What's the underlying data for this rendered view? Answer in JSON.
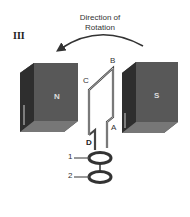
{
  "figure": {
    "panel_label": "III",
    "title_line1": "Direction of",
    "title_line2": "Rotation",
    "magnets": [
      {
        "pole": "N",
        "side": "left"
      },
      {
        "pole": "S",
        "side": "right"
      }
    ],
    "coil_corners": [
      "A",
      "B",
      "C",
      "D"
    ],
    "slip_rings": [
      "1",
      "2"
    ],
    "colors": {
      "magnet_front": "#5a5a5a",
      "magnet_side": "#3a3a3a",
      "magnet_top": "#7a7a7a",
      "line": "#444444"
    }
  }
}
